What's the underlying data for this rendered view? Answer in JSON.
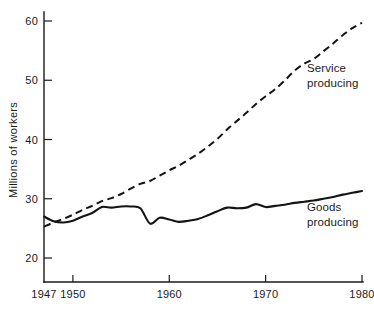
{
  "chart_data": {
    "type": "line",
    "title": "",
    "xlabel": "",
    "ylabel": "Millions of workers",
    "xlim": [
      1947,
      1980
    ],
    "ylim": [
      20,
      60
    ],
    "grid": false,
    "legend_position": "inline-right",
    "x_ticks": [
      {
        "value": 1947,
        "label": "1947"
      },
      {
        "value": 1950,
        "label": "1950"
      },
      {
        "value": 1960,
        "label": "1960"
      },
      {
        "value": 1970,
        "label": "1970"
      },
      {
        "value": 1980,
        "label": "1980"
      }
    ],
    "y_ticks": [
      {
        "value": 20,
        "label": "20"
      },
      {
        "value": 30,
        "label": "30"
      },
      {
        "value": 40,
        "label": "40"
      },
      {
        "value": 50,
        "label": "50"
      },
      {
        "value": 60,
        "label": "60"
      }
    ],
    "series": [
      {
        "name": "Service producing",
        "style": "dashed",
        "color": "#141414",
        "label_line1": "Service",
        "label_line2": "producing",
        "x": [
          1947,
          1948,
          1949,
          1950,
          1951,
          1952,
          1953,
          1954,
          1955,
          1956,
          1957,
          1958,
          1959,
          1960,
          1961,
          1962,
          1963,
          1964,
          1965,
          1966,
          1967,
          1968,
          1969,
          1970,
          1971,
          1972,
          1973,
          1974,
          1975,
          1976,
          1977,
          1978,
          1979,
          1980
        ],
        "values": [
          25.3,
          26.0,
          26.6,
          27.3,
          28.1,
          28.8,
          29.6,
          30.1,
          30.8,
          31.7,
          32.5,
          33.0,
          33.9,
          34.8,
          35.6,
          36.6,
          37.6,
          38.8,
          40.1,
          41.7,
          43.1,
          44.5,
          46.0,
          47.3,
          48.5,
          50.0,
          51.6,
          52.8,
          53.6,
          54.9,
          56.2,
          57.6,
          58.8,
          59.7
        ]
      },
      {
        "name": "Goods producing",
        "style": "solid",
        "color": "#141414",
        "label_line1": "Goods",
        "label_line2": "producing",
        "x": [
          1947,
          1948,
          1949,
          1950,
          1951,
          1952,
          1953,
          1954,
          1955,
          1956,
          1957,
          1958,
          1959,
          1960,
          1961,
          1962,
          1963,
          1964,
          1965,
          1966,
          1967,
          1968,
          1969,
          1970,
          1971,
          1972,
          1973,
          1974,
          1975,
          1976,
          1977,
          1978,
          1979,
          1980
        ],
        "values": [
          27.0,
          26.2,
          26.0,
          26.3,
          27.0,
          27.6,
          28.6,
          28.5,
          28.7,
          28.7,
          28.4,
          25.8,
          26.8,
          26.5,
          26.1,
          26.3,
          26.6,
          27.2,
          27.9,
          28.5,
          28.4,
          28.5,
          29.1,
          28.6,
          28.8,
          29.0,
          29.3,
          29.5,
          29.7,
          30.0,
          30.3,
          30.7,
          31.0,
          31.3
        ]
      }
    ]
  }
}
